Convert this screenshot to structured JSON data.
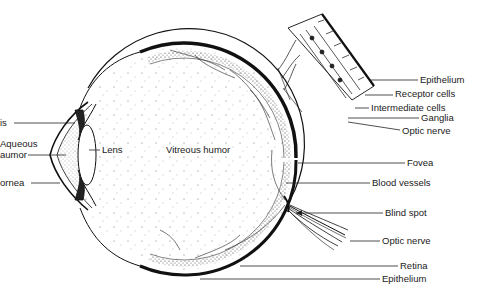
{
  "diagram": {
    "colors": {
      "ink": "#1a1a1a",
      "background": "#ffffff"
    },
    "labels_left": {
      "iris": "is",
      "aqueous_line1": "Aqueous",
      "aqueous_line2": "aumor",
      "cornea": "ornea"
    },
    "labels_center": {
      "lens": "Lens",
      "vitreous": "Vitreous humor"
    },
    "labels_inset": {
      "epithelium": "Epithelium",
      "receptor_cells": "Receptor cells",
      "intermediate_cells": "Intermediate cells",
      "ganglia": "Ganglia",
      "optic_nerve": "Optic nerve"
    },
    "labels_right": {
      "fovea": "Fovea",
      "blood_vessels": "Blood vessels",
      "blind_spot": "Blind spot",
      "optic_nerve": "Optic nerve",
      "retina": "Retina",
      "epithelium": "Epithelium"
    }
  }
}
